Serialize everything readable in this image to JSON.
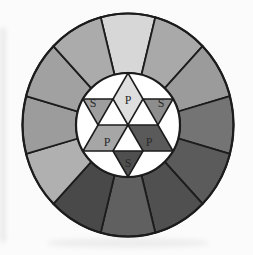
{
  "figure": {
    "kind": "color-wheel",
    "background": "#fbfbfb",
    "outline_color": "#1c1c1c",
    "letter_color": "#2a2a2a",
    "ring_segments": [
      {
        "clock": "12",
        "color": "#d7d7d7"
      },
      {
        "clock": "1",
        "color": "#a9a9a9"
      },
      {
        "clock": "2",
        "color": "#9b9b9b"
      },
      {
        "clock": "3",
        "color": "#747474"
      },
      {
        "clock": "4",
        "color": "#5b5b5b"
      },
      {
        "clock": "5",
        "color": "#505050"
      },
      {
        "clock": "6",
        "color": "#606060"
      },
      {
        "clock": "7",
        "color": "#494949"
      },
      {
        "clock": "8",
        "color": "#b0b0b0"
      },
      {
        "clock": "9",
        "color": "#9c9c9c"
      },
      {
        "clock": "10",
        "color": "#a1a1a1"
      },
      {
        "clock": "11",
        "color": "#ababab"
      }
    ],
    "inner": {
      "disc_color": "#ffffff",
      "primaries": [
        {
          "position": "top",
          "label": "P",
          "color": "#dedede"
        },
        {
          "position": "lower-left",
          "label": "P",
          "color": "#a6a6a6"
        },
        {
          "position": "lower-right",
          "label": "P",
          "color": "#5a5a5a"
        }
      ],
      "secondaries": [
        {
          "position": "left",
          "label": "S",
          "color": "#9e9e9e"
        },
        {
          "position": "right",
          "label": "S",
          "color": "#8d8d8d"
        },
        {
          "position": "bottom",
          "label": "S",
          "color": "#4f4f4f"
        }
      ]
    }
  }
}
